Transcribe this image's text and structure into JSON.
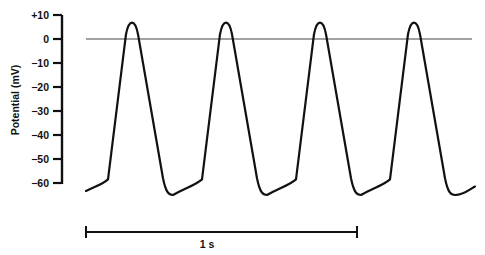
{
  "chart_data": {
    "type": "line",
    "title": "",
    "xlabel": "",
    "ylabel": "Potential (mV)",
    "ylim": [
      -60,
      10
    ],
    "y_ticks": [
      10,
      0,
      -10,
      -20,
      -30,
      -40,
      -50,
      -60
    ],
    "y_tick_labels": [
      "+10",
      "0",
      "−10",
      "−20",
      "−30",
      "−40",
      "−50",
      "−60"
    ],
    "grid": false,
    "legend": null,
    "reference_line": {
      "y": 0,
      "label": "0 mV"
    },
    "scale_bar": {
      "label": "1 s",
      "duration_s": 1
    },
    "series": [
      {
        "name": "Pacemaker action potentials",
        "description": "Four repetitive action potentials, peak ~+8 mV, maximum diastolic potential ~-65 mV, slow diastolic depolarization, cycle ~0.35 s",
        "x_s": [
          0.0,
          0.08,
          0.17,
          0.25,
          0.31,
          0.41,
          0.52,
          0.6,
          0.66,
          0.76,
          0.87,
          0.95,
          1.0,
          1.1,
          1.22,
          1.29
        ],
        "values": [
          -63,
          -58,
          8,
          -58,
          -65,
          -58,
          8,
          -58,
          -65,
          -58,
          8,
          -58,
          -65,
          -58,
          8,
          -64
        ]
      }
    ],
    "peaks_mV": [
      8,
      8,
      8,
      8
    ],
    "troughs_mV": [
      -65,
      -65,
      -65,
      -65
    ]
  },
  "axis": {
    "title": "Potential (mV)",
    "ticks": [
      {
        "label": "+10",
        "value": 10
      },
      {
        "label": "0",
        "value": 0
      },
      {
        "label": "−10",
        "value": -10
      },
      {
        "label": "−20",
        "value": -20
      },
      {
        "label": "−30",
        "value": -30
      },
      {
        "label": "−40",
        "value": -40
      },
      {
        "label": "−50",
        "value": -50
      },
      {
        "label": "−60",
        "value": -60
      }
    ]
  },
  "scale_bar": {
    "label": "1 s"
  }
}
